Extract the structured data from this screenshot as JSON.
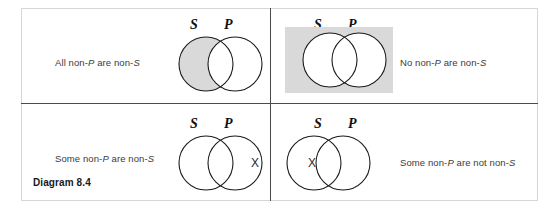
{
  "figure": {
    "caption_label": "Diagram 8.4",
    "colors": {
      "shading_gray": "#d9d9d9",
      "circle_stroke": "#1a1a1a",
      "frame_border": "#d6d6d6",
      "divider": "#4a4a4a",
      "text": "#3b3b3b"
    },
    "set_labels": {
      "subject": "S",
      "predicate": "P"
    },
    "x_marker": "X"
  },
  "quadrants": [
    {
      "id": "top-left",
      "proposition_prefix": "All non-",
      "proposition_text": "All non-P are non-S",
      "proposition_parts": [
        "All non-",
        "P",
        " are non-",
        "S"
      ],
      "text_position": "left",
      "shading": "s-only-region",
      "x_marker": null,
      "label_s": "S",
      "label_p": "P"
    },
    {
      "id": "top-right",
      "proposition_prefix": "No non-",
      "proposition_text": "No non-P are non-S",
      "proposition_parts": [
        "No non-",
        "P",
        " are non-",
        "S"
      ],
      "text_position": "right",
      "shading": "outside-both-rectangle",
      "x_marker": null,
      "label_s": "S",
      "label_p": "P"
    },
    {
      "id": "bottom-left",
      "proposition_prefix": "Some non-",
      "proposition_text": "Some non-P are non-S",
      "proposition_parts": [
        "Some non-",
        "P",
        " are non-",
        "S"
      ],
      "text_position": "left",
      "shading": "none",
      "x_marker": "X",
      "x_position": "outside-both-circles-right",
      "label_s": "S",
      "label_p": "P"
    },
    {
      "id": "bottom-right",
      "proposition_prefix": "Some non-",
      "proposition_text": "Some non-P are not non-S",
      "proposition_parts": [
        "Some non-",
        "P",
        " are not non-",
        "S"
      ],
      "text_position": "right",
      "shading": "none",
      "x_marker": "X",
      "x_position": "inside-s-only-region",
      "label_s": "S",
      "label_p": "P"
    }
  ]
}
